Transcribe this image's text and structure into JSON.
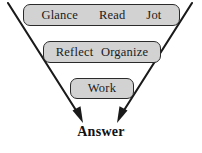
{
  "diagram": {
    "type": "funnel",
    "title": "",
    "background_color": "#ffffff",
    "box_fill_color": "#d2d2d2",
    "box_border_color": "#2b2b2b",
    "arrow_color": "#1a1a1a",
    "text_color": "#1a1a1a",
    "stages": [
      {
        "id": "stage-1",
        "items": [
          "Glance",
          "Read",
          "Jot"
        ]
      },
      {
        "id": "stage-2",
        "items": [
          "Reflect",
          "Organize"
        ]
      },
      {
        "id": "stage-3",
        "items": [
          "Work"
        ]
      }
    ],
    "outcome": {
      "label": "Answer"
    },
    "arrows": [
      {
        "name": "left-funnel-arrow",
        "from": [
          8,
          3
        ],
        "to": [
          83,
          122
        ]
      },
      {
        "name": "right-funnel-arrow",
        "from": [
          192,
          3
        ],
        "to": [
          117,
          122
        ]
      }
    ]
  }
}
